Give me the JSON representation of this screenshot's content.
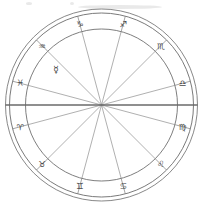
{
  "figure": {
    "background_color": "#ffffff",
    "line_color": "#6b6b6b",
    "glyph_color": "#4a4a4a"
  },
  "chart_data": {
    "type": "pie",
    "subtitle": "Twelve-house zodiac wheel with Mercury placement",
    "xlabel": "",
    "ylabel": "",
    "grid": false,
    "legend_position": "none",
    "center": {
      "x": 101.5,
      "y": 105
    },
    "radii": {
      "outer_ring_outer": 96,
      "outer_ring_mid": 92,
      "zodiac_band_inner": 76,
      "inner_wheel": 76
    },
    "house_count": 12,
    "slice_degrees": 30,
    "ascendant_degrees": 180,
    "categories": [
      "Aries",
      "Taurus",
      "Gemini",
      "Cancer",
      "Leo",
      "Virgo",
      "Libra",
      "Scorpio",
      "Sagittarius",
      "Capricorn",
      "Aquarius",
      "Pisces"
    ],
    "values": [
      30,
      30,
      30,
      30,
      30,
      30,
      30,
      30,
      30,
      30,
      30,
      30
    ],
    "series": [
      {
        "name": "Zodiac signs",
        "values": [
          30,
          30,
          30,
          30,
          30,
          30,
          30,
          30,
          30,
          30,
          30,
          30
        ]
      }
    ]
  },
  "wheel": {
    "signs": [
      {
        "name": "Aries",
        "glyph": "♈",
        "glyph_name": "aries-glyph",
        "angle_deg": 195,
        "label_radius": 84
      },
      {
        "name": "Taurus",
        "glyph": "♉",
        "glyph_name": "taurus-glyph",
        "angle_deg": 225,
        "label_radius": 84
      },
      {
        "name": "Gemini",
        "glyph": "♊",
        "glyph_name": "gemini-glyph",
        "angle_deg": 255,
        "label_radius": 84
      },
      {
        "name": "Cancer",
        "glyph": "♋",
        "glyph_name": "cancer-glyph",
        "angle_deg": 285,
        "label_radius": 84
      },
      {
        "name": "Leo",
        "glyph": "♌",
        "glyph_name": "leo-glyph",
        "angle_deg": 315,
        "label_radius": 84
      },
      {
        "name": "Virgo",
        "glyph": "♍",
        "glyph_name": "virgo-glyph",
        "angle_deg": 345,
        "label_radius": 84
      },
      {
        "name": "Libra",
        "glyph": "♎",
        "glyph_name": "libra-glyph",
        "angle_deg": 15,
        "label_radius": 84
      },
      {
        "name": "Scorpio",
        "glyph": "♏",
        "glyph_name": "scorpio-glyph",
        "angle_deg": 45,
        "label_radius": 84
      },
      {
        "name": "Sagittarius",
        "glyph": "♐",
        "glyph_name": "sagittarius-glyph",
        "angle_deg": 75,
        "label_radius": 84
      },
      {
        "name": "Capricorn",
        "glyph": "♑",
        "glyph_name": "capricorn-glyph",
        "angle_deg": 105,
        "label_radius": 84
      },
      {
        "name": "Aquarius",
        "glyph": "♒",
        "glyph_name": "aquarius-glyph",
        "angle_deg": 135,
        "label_radius": 84
      },
      {
        "name": "Pisces",
        "glyph": "♓",
        "glyph_name": "pisces-glyph",
        "angle_deg": 165,
        "label_radius": 84
      }
    ],
    "cusp_angles_deg": [
      15,
      45,
      75,
      105,
      135,
      165,
      195,
      225,
      255,
      285,
      315,
      345
    ],
    "planets": [
      {
        "name": "Mercury",
        "glyph": "☿",
        "glyph_name": "mercury-glyph",
        "angle_deg": 142,
        "radius": 58
      }
    ],
    "axes": [
      {
        "name": "ascendant-descendant-axis",
        "angle_deg": 180,
        "label": "Ascendant – Descendant"
      }
    ]
  }
}
